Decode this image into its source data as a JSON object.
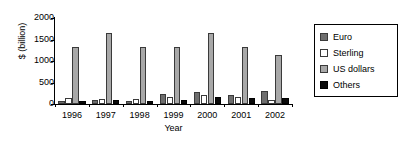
{
  "chart_data": {
    "type": "bar",
    "title": "",
    "xlabel": "Year",
    "ylabel": "$ (billion)",
    "categories": [
      "1996",
      "1997",
      "1998",
      "1999",
      "2000",
      "2001",
      "2002"
    ],
    "ylim": [
      0,
      2000
    ],
    "yticks": [
      0,
      500,
      1000,
      1500,
      2000
    ],
    "ytick_labels": [
      "0",
      "500",
      "1000",
      "1500",
      "2000"
    ],
    "grid": false,
    "legend_position": "right",
    "series": [
      {
        "name": "Euro",
        "color": "#6e6e6e",
        "values": [
          75,
          95,
          80,
          230,
          280,
          215,
          300
        ]
      },
      {
        "name": "Sterling",
        "color": "#ffffff",
        "values": [
          130,
          110,
          115,
          160,
          200,
          155,
          105
        ]
      },
      {
        "name": "US dollars",
        "color": "#a8a8a8",
        "values": [
          1320,
          1640,
          1320,
          1330,
          1650,
          1330,
          1150
        ]
      },
      {
        "name": "Others",
        "color": "#0a0a0a",
        "values": [
          80,
          90,
          70,
          85,
          170,
          145,
          130
        ]
      }
    ]
  },
  "legend": {
    "items": [
      {
        "label": "Euro"
      },
      {
        "label": "Sterling"
      },
      {
        "label": "US dollars"
      },
      {
        "label": "Others"
      }
    ]
  }
}
